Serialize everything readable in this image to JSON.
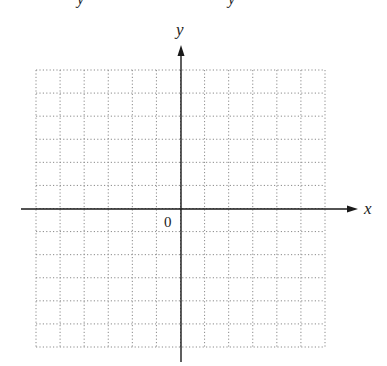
{
  "diagram": {
    "type": "coordinate-grid",
    "x_axis_label": "x",
    "y_axis_label": "y",
    "origin_label": "0",
    "top_cutoff_glyphs": [
      "y",
      "y"
    ],
    "grid": {
      "columns": 12,
      "rows": 12,
      "style": "dotted"
    },
    "colors": {
      "axis": "#1a1a1a",
      "grid": "#8a8a8a",
      "text": "#222222"
    }
  }
}
